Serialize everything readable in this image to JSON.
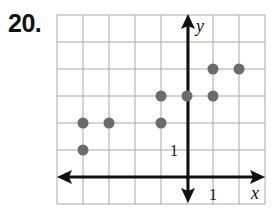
{
  "problem": {
    "number_label": "20."
  },
  "chart_data": {
    "type": "scatter",
    "title": "",
    "xlabel": "x",
    "ylabel": "y",
    "xlim": [
      -5,
      3
    ],
    "ylim": [
      -1,
      6
    ],
    "grid": true,
    "legend": "none",
    "tick_labels": {
      "x": "1",
      "y": "1"
    },
    "x": [
      -4,
      -3,
      -4,
      -1,
      -1,
      0,
      1,
      1,
      2
    ],
    "y": [
      2,
      2,
      1,
      2,
      3,
      3,
      3,
      4,
      4
    ],
    "points": [
      {
        "x": -4,
        "y": 2
      },
      {
        "x": -3,
        "y": 2
      },
      {
        "x": -4,
        "y": 1
      },
      {
        "x": -1,
        "y": 2
      },
      {
        "x": -1,
        "y": 3
      },
      {
        "x": 0,
        "y": 3
      },
      {
        "x": 1,
        "y": 3
      },
      {
        "x": 1,
        "y": 4
      },
      {
        "x": 2,
        "y": 4
      }
    ],
    "colors": {
      "points": "#6b6b6b",
      "grid": "#a9a9a9",
      "axes": "#111111"
    }
  }
}
